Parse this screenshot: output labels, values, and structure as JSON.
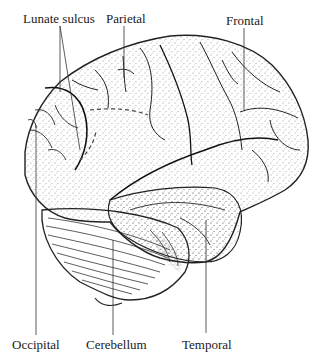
{
  "diagram": {
    "labels": {
      "lunate_sulcus": "Lunate sulcus",
      "parietal": "Parietal",
      "frontal": "Frontal",
      "occipital": "Occipital",
      "cerebellum": "Cerebellum",
      "temporal": "Temporal"
    }
  }
}
